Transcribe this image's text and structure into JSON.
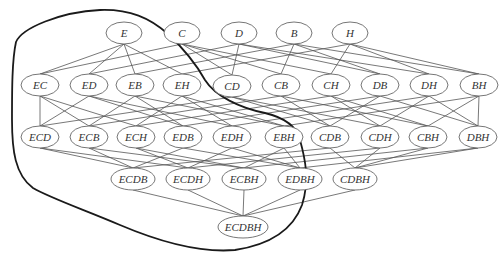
{
  "diagram": {
    "type": "subset-lattice",
    "colors": {
      "edge": "#555555",
      "node_stroke": "#666666",
      "boundary": "#1a1a1a",
      "background": "#ffffff"
    },
    "nodes": [
      {
        "id": "E",
        "label": "E",
        "x": 124,
        "y": 33,
        "rx": 18
      },
      {
        "id": "C",
        "label": "C",
        "x": 182,
        "y": 33,
        "rx": 18
      },
      {
        "id": "D",
        "label": "D",
        "x": 239,
        "y": 33,
        "rx": 18
      },
      {
        "id": "B",
        "label": "B",
        "x": 294,
        "y": 33,
        "rx": 18
      },
      {
        "id": "H",
        "label": "H",
        "x": 350,
        "y": 33,
        "rx": 18
      },
      {
        "id": "EC",
        "label": "EC",
        "x": 40,
        "y": 85,
        "rx": 19
      },
      {
        "id": "ED",
        "label": "ED",
        "x": 89,
        "y": 85,
        "rx": 19
      },
      {
        "id": "EB",
        "label": "EB",
        "x": 135,
        "y": 85,
        "rx": 19
      },
      {
        "id": "EH",
        "label": "EH",
        "x": 182,
        "y": 85,
        "rx": 19
      },
      {
        "id": "CD",
        "label": "CD",
        "x": 232,
        "y": 86,
        "rx": 19
      },
      {
        "id": "CB",
        "label": "CB",
        "x": 281,
        "y": 85,
        "rx": 19
      },
      {
        "id": "CH",
        "label": "CH",
        "x": 331,
        "y": 85,
        "rx": 19
      },
      {
        "id": "DB",
        "label": "DB",
        "x": 380,
        "y": 85,
        "rx": 19
      },
      {
        "id": "DH",
        "label": "DH",
        "x": 429,
        "y": 85,
        "rx": 19
      },
      {
        "id": "BH",
        "label": "BH",
        "x": 479,
        "y": 85,
        "rx": 19
      },
      {
        "id": "ECD",
        "label": "ECD",
        "x": 40,
        "y": 137,
        "rx": 19
      },
      {
        "id": "ECB",
        "label": "ECB",
        "x": 89,
        "y": 137,
        "rx": 19
      },
      {
        "id": "ECH",
        "label": "ECH",
        "x": 136,
        "y": 137,
        "rx": 19
      },
      {
        "id": "EDB",
        "label": "EDB",
        "x": 183,
        "y": 137,
        "rx": 19
      },
      {
        "id": "EDH",
        "label": "EDH",
        "x": 232,
        "y": 137,
        "rx": 19
      },
      {
        "id": "EBH",
        "label": "EBH",
        "x": 284,
        "y": 137,
        "rx": 19
      },
      {
        "id": "CDB",
        "label": "CDB",
        "x": 330,
        "y": 137,
        "rx": 19
      },
      {
        "id": "CDH",
        "label": "CDH",
        "x": 380,
        "y": 137,
        "rx": 19
      },
      {
        "id": "CBH",
        "label": "CBH",
        "x": 428,
        "y": 137,
        "rx": 19
      },
      {
        "id": "DBH",
        "label": "DBH",
        "x": 478,
        "y": 137,
        "rx": 19
      },
      {
        "id": "ECDB",
        "label": "ECDB",
        "x": 133,
        "y": 179,
        "rx": 22
      },
      {
        "id": "ECDH",
        "label": "ECDH",
        "x": 188,
        "y": 179,
        "rx": 22
      },
      {
        "id": "ECBH",
        "label": "ECBH",
        "x": 244,
        "y": 179,
        "rx": 22
      },
      {
        "id": "EDBH",
        "label": "EDBH",
        "x": 300,
        "y": 179,
        "rx": 22
      },
      {
        "id": "CDBH",
        "label": "CDBH",
        "x": 355,
        "y": 179,
        "rx": 22
      },
      {
        "id": "ECDBH",
        "label": "ECDBH",
        "x": 243,
        "y": 227,
        "rx": 25
      }
    ],
    "edges": [
      [
        "E",
        "EC"
      ],
      [
        "E",
        "ED"
      ],
      [
        "E",
        "EB"
      ],
      [
        "E",
        "EH"
      ],
      [
        "C",
        "EC"
      ],
      [
        "C",
        "CD"
      ],
      [
        "C",
        "CB"
      ],
      [
        "C",
        "CH"
      ],
      [
        "D",
        "ED"
      ],
      [
        "D",
        "CD"
      ],
      [
        "D",
        "DB"
      ],
      [
        "D",
        "DH"
      ],
      [
        "B",
        "EB"
      ],
      [
        "B",
        "CB"
      ],
      [
        "B",
        "DB"
      ],
      [
        "B",
        "BH"
      ],
      [
        "H",
        "EH"
      ],
      [
        "H",
        "CH"
      ],
      [
        "H",
        "DH"
      ],
      [
        "H",
        "BH"
      ],
      [
        "EC",
        "ECD"
      ],
      [
        "EC",
        "ECB"
      ],
      [
        "EC",
        "ECH"
      ],
      [
        "ED",
        "ECD"
      ],
      [
        "ED",
        "EDB"
      ],
      [
        "ED",
        "EDH"
      ],
      [
        "EB",
        "ECB"
      ],
      [
        "EB",
        "EDB"
      ],
      [
        "EB",
        "EBH"
      ],
      [
        "EH",
        "ECH"
      ],
      [
        "EH",
        "EDH"
      ],
      [
        "EH",
        "EBH"
      ],
      [
        "CD",
        "ECD"
      ],
      [
        "CD",
        "CDB"
      ],
      [
        "CD",
        "CDH"
      ],
      [
        "CB",
        "ECB"
      ],
      [
        "CB",
        "CDB"
      ],
      [
        "CB",
        "CBH"
      ],
      [
        "CH",
        "ECH"
      ],
      [
        "CH",
        "CDH"
      ],
      [
        "CH",
        "CBH"
      ],
      [
        "DB",
        "EDB"
      ],
      [
        "DB",
        "CDB"
      ],
      [
        "DB",
        "DBH"
      ],
      [
        "DH",
        "EDH"
      ],
      [
        "DH",
        "CDH"
      ],
      [
        "DH",
        "DBH"
      ],
      [
        "BH",
        "EBH"
      ],
      [
        "BH",
        "CBH"
      ],
      [
        "BH",
        "DBH"
      ],
      [
        "ECD",
        "ECDB"
      ],
      [
        "ECD",
        "ECDH"
      ],
      [
        "ECB",
        "ECDB"
      ],
      [
        "ECB",
        "ECBH"
      ],
      [
        "ECH",
        "ECDH"
      ],
      [
        "ECH",
        "ECBH"
      ],
      [
        "EDB",
        "ECDB"
      ],
      [
        "EDB",
        "EDBH"
      ],
      [
        "EDH",
        "ECDH"
      ],
      [
        "EDH",
        "EDBH"
      ],
      [
        "EBH",
        "ECBH"
      ],
      [
        "EBH",
        "EDBH"
      ],
      [
        "CDB",
        "ECDB"
      ],
      [
        "CDB",
        "CDBH"
      ],
      [
        "CDH",
        "ECDH"
      ],
      [
        "CDH",
        "CDBH"
      ],
      [
        "CBH",
        "ECBH"
      ],
      [
        "CBH",
        "CDBH"
      ],
      [
        "DBH",
        "EDBH"
      ],
      [
        "DBH",
        "CDBH"
      ],
      [
        "ECDB",
        "ECDBH"
      ],
      [
        "ECDH",
        "ECDBH"
      ],
      [
        "ECBH",
        "ECDBH"
      ],
      [
        "EDBH",
        "ECDBH"
      ],
      [
        "CDBH",
        "ECDBH"
      ]
    ],
    "boundary_path": "M 16 42 C 22 28, 60 12, 100 10 C 130 9, 150 18, 168 34 C 185 50, 195 62, 205 80 C 215 96, 240 108, 265 113 C 282 117, 296 124, 300 140 C 305 158, 310 180, 302 205 C 292 232, 268 245, 235 250 C 200 253, 160 242, 120 225 C 85 210, 50 198, 33 188 C 15 175, 12 150, 12 120 C 12 90, 12 60, 16 42 Z"
  }
}
